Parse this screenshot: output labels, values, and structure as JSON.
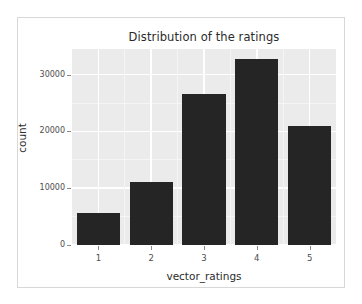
{
  "chart_data": {
    "type": "bar",
    "title": "Distribution of the ratings",
    "xlabel": "vector_ratings",
    "ylabel": "count",
    "categories": [
      "1",
      "2",
      "3",
      "4",
      "5"
    ],
    "values": [
      5700,
      11100,
      26500,
      32800,
      21000
    ],
    "ylim": [
      0,
      34500
    ],
    "yticks": [
      0,
      10000,
      20000,
      30000
    ],
    "ytick_labels": [
      "0",
      "10000",
      "20000",
      "30000"
    ],
    "xtick_labels": [
      "1",
      "2",
      "3",
      "4",
      "5"
    ],
    "grid": true,
    "legend": null,
    "legend_position": "none",
    "bar_color": "#252525",
    "panel_background": "#ebebeb",
    "gridline_color": "#ffffff",
    "figure_background": "#ffffff",
    "axis_text_color": "#4d4d4d",
    "title_color": "#2b2b2b"
  }
}
